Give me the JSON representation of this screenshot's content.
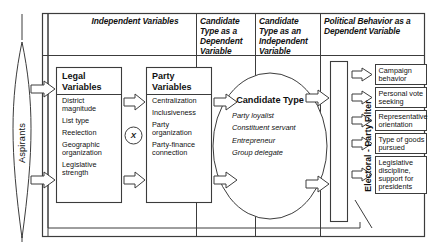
{
  "diagram": {
    "headers": {
      "independent_variables": "Independent Variables",
      "candidate_dependent": "Candidate Type as a Dependent Variable",
      "candidate_independent": "Candidate Type as an Independent Variable",
      "political_behavior": "Political Behavior as a Dependent Variable"
    },
    "aspirants": {
      "label": "Aspirants"
    },
    "legal_variables": {
      "title": "Legal Variables",
      "items": [
        "District magnitude",
        "List type",
        "Reelection",
        "Geographic organization",
        "Legislative strength"
      ]
    },
    "interaction": {
      "symbol": "X"
    },
    "party_variables": {
      "title": "Party Variables",
      "items": [
        "Centralization",
        "Inclusiveness",
        "Party organization",
        "Party-finance connection"
      ]
    },
    "candidate_type": {
      "title": "Candidate Type",
      "items": [
        "Party loyalist",
        "Constituent servant",
        "Entrepreneur",
        "Group delegate"
      ]
    },
    "filter": {
      "label": "Electoral - Party Filter"
    },
    "outcomes": [
      "Campaign behavior",
      "Personal vote seeking",
      "Representative orientation",
      "Type of goods pursued",
      "Legislative discipline, support for presidents"
    ],
    "colors": {
      "line": "#3c3c3c",
      "text": "#111111",
      "background": "#ffffff"
    }
  }
}
